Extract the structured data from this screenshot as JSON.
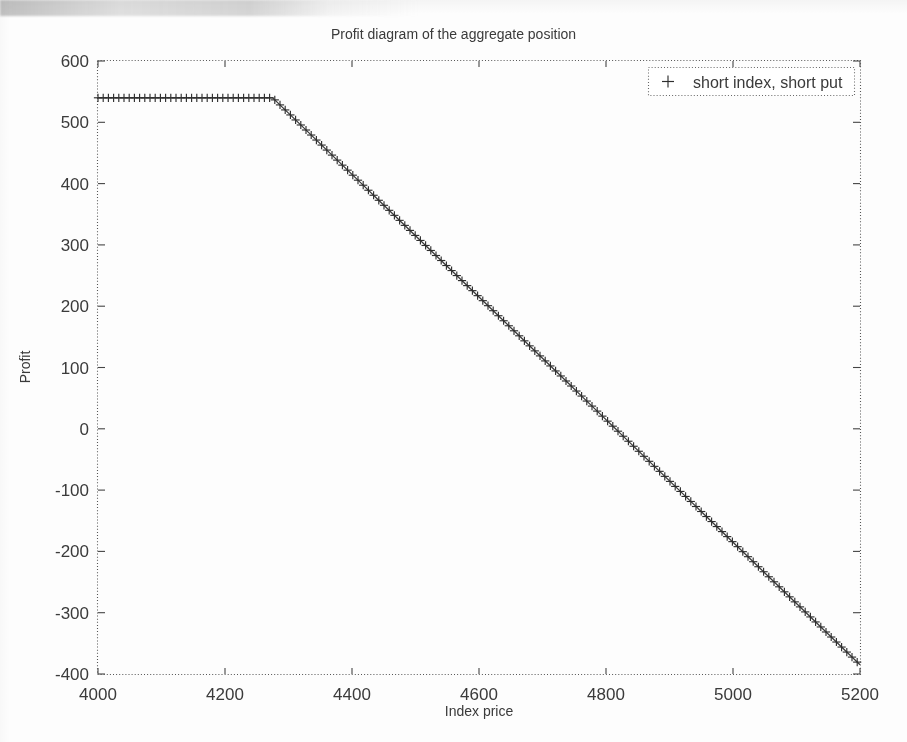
{
  "chart_data": {
    "type": "line",
    "title": "Profit diagram of the aggregate position",
    "xlabel": "Index price",
    "ylabel": "Profit",
    "xlim": [
      4000,
      5200
    ],
    "ylim": [
      -400,
      600
    ],
    "xticks": [
      4000,
      4200,
      4400,
      4600,
      4800,
      5000,
      5200
    ],
    "yticks": [
      600,
      500,
      400,
      300,
      200,
      100,
      0,
      -100,
      -200,
      -300,
      -400
    ],
    "grid": false,
    "legend_position": "upper right",
    "marker": "+",
    "series": [
      {
        "name": "short index, short put",
        "marker": "+",
        "strike": 4275,
        "plateau_profit": 540,
        "x": [
          4000,
          4020,
          4040,
          4060,
          4080,
          4100,
          4120,
          4140,
          4160,
          4180,
          4200,
          4220,
          4240,
          4260,
          4275,
          4300,
          4320,
          4340,
          4360,
          4380,
          4400,
          4420,
          4440,
          4460,
          4480,
          4500,
          4520,
          4540,
          4560,
          4580,
          4600,
          4620,
          4640,
          4660,
          4680,
          4700,
          4720,
          4740,
          4760,
          4780,
          4800,
          4815,
          4820,
          4840,
          4860,
          4880,
          4900,
          4920,
          4940,
          4960,
          4980,
          5000,
          5020,
          5040,
          5060,
          5080,
          5100,
          5120,
          5140,
          5160,
          5180,
          5200
        ],
        "y": [
          540,
          540,
          540,
          540,
          540,
          540,
          540,
          540,
          540,
          540,
          540,
          540,
          540,
          540,
          540,
          515,
          495,
          475,
          455,
          435,
          415,
          395,
          375,
          355,
          335,
          315,
          295,
          275,
          255,
          235,
          215,
          195,
          175,
          155,
          135,
          115,
          95,
          75,
          55,
          35,
          15,
          0,
          -5,
          -25,
          -45,
          -65,
          -85,
          -105,
          -125,
          -145,
          -165,
          -185,
          -205,
          -225,
          -245,
          -265,
          -285,
          -305,
          -325,
          -345,
          -365,
          -385
        ]
      }
    ],
    "annotations": {
      "zero_crossing_x": 4815,
      "slope_after_strike": -1
    }
  },
  "legend": {
    "entries": [
      {
        "label": "short index, short put",
        "marker_glyph": "+"
      }
    ]
  },
  "axes": {
    "x_tick_labels": [
      "4000",
      "4200",
      "4400",
      "4600",
      "4800",
      "5000",
      "5200"
    ],
    "y_tick_labels": [
      "600",
      "500",
      "400",
      "300",
      "200",
      "100",
      "0",
      "-100",
      "-200",
      "-300",
      "-400"
    ]
  }
}
